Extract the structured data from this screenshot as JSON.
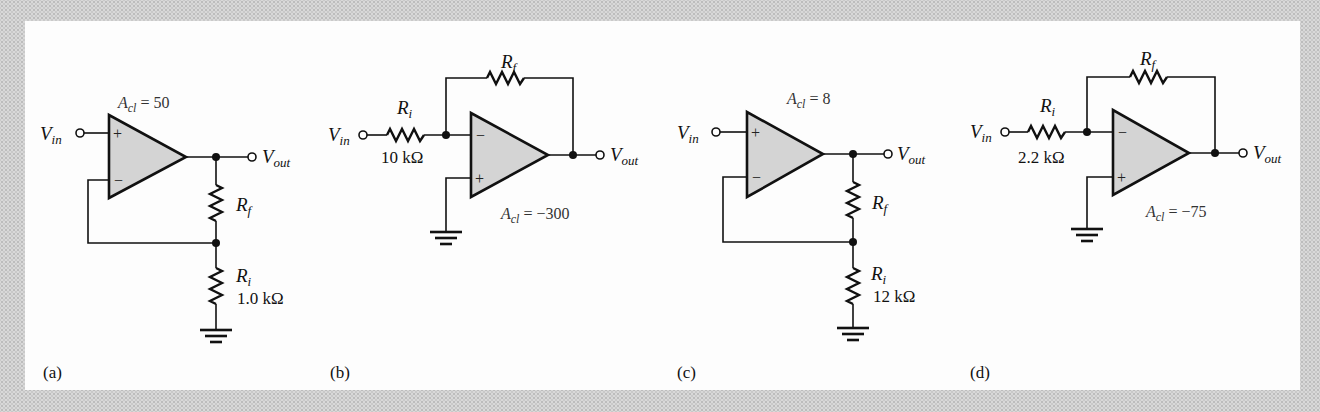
{
  "figure": {
    "background_color": "#d9d9d9",
    "panel_color": "#fdfdfd",
    "opamp_fill": "#d4d4d4",
    "circuits": [
      {
        "id": "a",
        "caption": "(a)",
        "type": "non-inverting amplifier",
        "gain_prefix": "A",
        "gain_sub": "cl",
        "gain_value": " = 50",
        "vin": {
          "main": "V",
          "sub": "in"
        },
        "vout": {
          "main": "V",
          "sub": "out"
        },
        "rf": {
          "main": "R",
          "sub": "f"
        },
        "ri": {
          "main": "R",
          "sub": "i",
          "value": "1.0 kΩ"
        },
        "plus": "+",
        "minus": "−"
      },
      {
        "id": "b",
        "caption": "(b)",
        "type": "inverting amplifier",
        "gain_prefix": "A",
        "gain_sub": "cl",
        "gain_value": " = −300",
        "vin": {
          "main": "V",
          "sub": "in"
        },
        "vout": {
          "main": "V",
          "sub": "out"
        },
        "rf": {
          "main": "R",
          "sub": "f"
        },
        "ri": {
          "main": "R",
          "sub": "i",
          "value": "10 kΩ"
        },
        "plus": "+",
        "minus": "−"
      },
      {
        "id": "c",
        "caption": "(c)",
        "type": "non-inverting amplifier",
        "gain_prefix": "A",
        "gain_sub": "cl",
        "gain_value": " = 8",
        "vin": {
          "main": "V",
          "sub": "in"
        },
        "vout": {
          "main": "V",
          "sub": "out"
        },
        "rf": {
          "main": "R",
          "sub": "f"
        },
        "ri": {
          "main": "R",
          "sub": "i",
          "value": "12 kΩ"
        },
        "plus": "+",
        "minus": "−"
      },
      {
        "id": "d",
        "caption": "(d)",
        "type": "inverting amplifier",
        "gain_prefix": "A",
        "gain_sub": "cl",
        "gain_value": " = −75",
        "vin": {
          "main": "V",
          "sub": "in"
        },
        "vout": {
          "main": "V",
          "sub": "out"
        },
        "rf": {
          "main": "R",
          "sub": "f"
        },
        "ri": {
          "main": "R",
          "sub": "i",
          "value": "2.2 kΩ"
        },
        "plus": "+",
        "minus": "−"
      }
    ]
  }
}
